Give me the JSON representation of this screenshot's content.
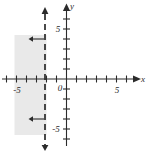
{
  "figure": {
    "type": "graph"
  },
  "axes": {
    "x_label": "x",
    "y_label": "y",
    "origin_label": "0",
    "x_tick_labels": [
      {
        "value": -5,
        "text": "-5"
      },
      {
        "value": 5,
        "text": "5"
      }
    ],
    "y_tick_labels": [
      {
        "value": 5,
        "text": "5"
      },
      {
        "value": -5,
        "text": "-5"
      }
    ],
    "x_range": [
      -6.6,
      7.6
    ],
    "y_range": [
      -7.2,
      6.8
    ],
    "tick_step": 1,
    "axis_color": "#2b2b2b"
  },
  "chart_data": {
    "type": "line",
    "title": "",
    "xlabel": "x",
    "ylabel": "y",
    "xlim": [
      -6.6,
      7.6
    ],
    "ylim": [
      -7.2,
      6.8
    ],
    "grid": false,
    "legend": "none",
    "boundary_line": {
      "style": "dashed",
      "orientation": "vertical",
      "x": -2,
      "color": "#2b2b2b",
      "arrow_top": true,
      "arrow_bottom": true
    },
    "shaded_region": {
      "description": "half-plane to the left of the dashed line",
      "x_from": -5.2,
      "x_to": -2,
      "y_from": -5.6,
      "y_to": 4.4,
      "fill": "#e9e9e9"
    },
    "direction_arrows": [
      {
        "at_x": -2,
        "at_y": 2.9,
        "points": "left"
      },
      {
        "at_x": -2,
        "at_y": -4.1,
        "points": "left"
      }
    ]
  },
  "colors": {
    "ink": "#2b2b2b",
    "shade": "#e9e9e9",
    "background": "#ffffff"
  }
}
